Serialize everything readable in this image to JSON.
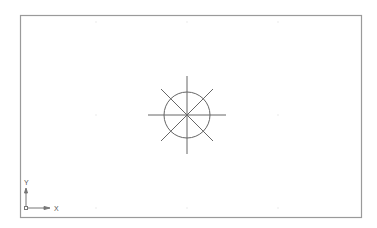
{
  "drawing": {
    "background": "#ffffff",
    "border_color": "#9a9a9a",
    "line_color": "#666666",
    "grid_color": "#e6e6e6"
  },
  "ucs_icon": {
    "x_label": "X",
    "y_label": "Y"
  }
}
